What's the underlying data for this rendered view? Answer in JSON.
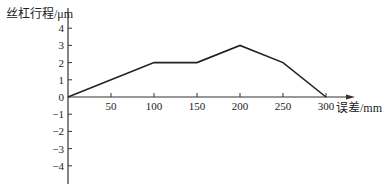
{
  "chart_data": {
    "type": "line",
    "title": "",
    "ylabel": "丝杠行程/μm",
    "xlabel": "误差/mm",
    "x": [
      0,
      100,
      150,
      200,
      250,
      300
    ],
    "series": [
      {
        "name": "丝杠行程误差",
        "values": [
          0,
          2,
          2,
          3,
          2,
          0
        ]
      }
    ],
    "xticks": [
      50,
      100,
      150,
      200,
      250,
      300
    ],
    "xtick_labels": [
      "50",
      "100",
      "150",
      "200",
      "250",
      "300"
    ],
    "yticks": [
      4,
      3,
      2,
      1,
      0,
      -1,
      -2,
      -3,
      -4
    ],
    "ytick_labels": [
      "4",
      "3",
      "2",
      "1",
      "0",
      "−1",
      "−2",
      "−3",
      "−4"
    ],
    "xlim": [
      0,
      330
    ],
    "ylim": [
      -4.5,
      5
    ],
    "grid": false,
    "legend": "none",
    "line_color": "#222222"
  }
}
